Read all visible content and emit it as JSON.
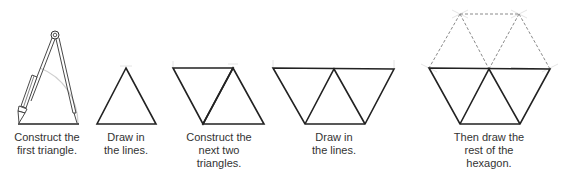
{
  "colors": {
    "line": "#222222",
    "construction": "#cccccc",
    "dashed": "#8a8a8a",
    "text": "#333333",
    "background": "#ffffff"
  },
  "steps": [
    {
      "id": "step-1",
      "caption": [
        "Construct the",
        "first triangle."
      ],
      "illustration": "compass-drawing-arc-on-base-line"
    },
    {
      "id": "step-2",
      "caption": [
        "Draw in",
        "the lines."
      ],
      "illustration": "single-equilateral-triangle"
    },
    {
      "id": "step-3",
      "caption": [
        "Construct the",
        "next two",
        "triangles."
      ],
      "illustration": "two-triangles-parallelogram"
    },
    {
      "id": "step-4",
      "caption": [
        "Draw in",
        "the lines."
      ],
      "illustration": "three-triangles-trapezoid"
    },
    {
      "id": "step-5",
      "caption": [
        "Then draw the",
        "rest of the",
        "hexagon."
      ],
      "illustration": "hexagon-with-dashed-upper-half"
    }
  ]
}
